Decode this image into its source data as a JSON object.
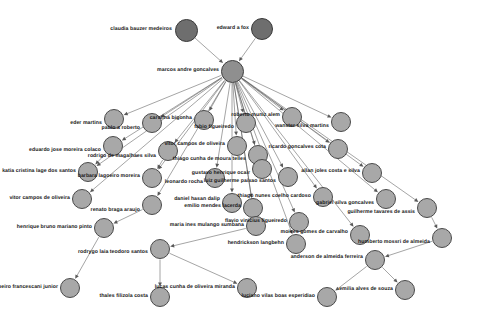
{
  "figure": {
    "type": "directed-graph",
    "title": "",
    "background_color": "#ffffff",
    "node_fill": "#a8a8a8",
    "node_fill_root": "#6e6e6e",
    "node_fill_hub": "#8f8f8f",
    "node_stroke": "#4a4a4a",
    "edge_color": "#595959"
  },
  "chart_data": {
    "type": "graph",
    "directed": true,
    "node_count": 35,
    "edge_count": 40,
    "nodes": [
      {
        "id": "claudia",
        "label": "claudia bauzer medeiros",
        "x": 186,
        "y": 30,
        "r": 11.5,
        "level": "root",
        "label_x": 172,
        "label_y": 30,
        "anchor": "end"
      },
      {
        "id": "edward",
        "label": "edward a fox",
        "x": 262,
        "y": 29,
        "r": 11.0,
        "level": "root",
        "label_x": 249,
        "label_y": 29,
        "anchor": "end"
      },
      {
        "id": "marcos",
        "label": "marcos andre goncalves",
        "x": 232,
        "y": 71,
        "r": 11.5,
        "level": "hub",
        "label_x": 219,
        "label_y": 71,
        "anchor": "end"
      },
      {
        "id": "eder",
        "label": "eder martins",
        "x": 114,
        "y": 119,
        "r": 10.0,
        "level": "child",
        "label_x": 102,
        "label_y": 124,
        "anchor": "end"
      },
      {
        "id": "pablo",
        "label": "pablo a roberto",
        "x": 152,
        "y": 123,
        "r": 10.0,
        "level": "child",
        "label_x": 140,
        "label_y": 129,
        "anchor": "end"
      },
      {
        "id": "carolina",
        "label": "carolina bigonha",
        "x": 204,
        "y": 120,
        "r": 10.0,
        "level": "child",
        "label_x": 192,
        "label_y": 119,
        "anchor": "end"
      },
      {
        "id": "fabio",
        "label": "fabio figueiredo",
        "x": 246,
        "y": 123,
        "r": 10.0,
        "level": "child",
        "label_x": 234,
        "label_y": 128,
        "anchor": "end"
      },
      {
        "id": "robertom",
        "label": "roberto muniz alem",
        "x": 292,
        "y": 117,
        "r": 10.0,
        "level": "child",
        "label_x": 280,
        "label_y": 116,
        "anchor": "end"
      },
      {
        "id": "wanster",
        "label": "wanster silva martins",
        "x": 341,
        "y": 122,
        "r": 10.0,
        "level": "child",
        "label_x": 329,
        "label_y": 127,
        "anchor": "end"
      },
      {
        "id": "eduardo",
        "label": "eduardo jose moreira colaco",
        "x": 113,
        "y": 146,
        "r": 10.0,
        "level": "child",
        "label_x": 101,
        "label_y": 151,
        "anchor": "end"
      },
      {
        "id": "rodrigo",
        "label": "rodrigo de magalhaes silva",
        "x": 168,
        "y": 151,
        "r": 10.0,
        "level": "child",
        "label_x": 156,
        "label_y": 157,
        "anchor": "end"
      },
      {
        "id": "vitorc1",
        "label": "vitor campos de oliveira",
        "x": 237,
        "y": 146,
        "r": 10.0,
        "level": "child",
        "label_x": 225,
        "label_y": 145,
        "anchor": "end"
      },
      {
        "id": "thiagocm",
        "label": "thiago cunha de moura telles",
        "x": 258,
        "y": 155,
        "r": 10.0,
        "level": "child",
        "label_x": 246,
        "label_y": 160,
        "anchor": "end"
      },
      {
        "id": "ricardo",
        "label": "ricardo goncalves cota",
        "x": 338,
        "y": 149,
        "r": 10.0,
        "level": "child",
        "label_x": 326,
        "label_y": 148,
        "anchor": "end"
      },
      {
        "id": "katia",
        "label": "katia cristina lage dos santos",
        "x": 88,
        "y": 172,
        "r": 10.0,
        "level": "child",
        "label_x": 76,
        "label_y": 172,
        "anchor": "end"
      },
      {
        "id": "barbara",
        "label": "barbara lagoeiro moreira",
        "x": 152,
        "y": 178,
        "r": 10.0,
        "level": "child",
        "label_x": 140,
        "label_y": 177,
        "anchor": "end"
      },
      {
        "id": "leonardo",
        "label": "leonardo rocha",
        "x": 215,
        "y": 178,
        "r": 10.0,
        "level": "child",
        "label_x": 203,
        "label_y": 183,
        "anchor": "end"
      },
      {
        "id": "gustavo",
        "label": "gustavo henrique ocair",
        "x": 262,
        "y": 169,
        "r": 10.0,
        "level": "child",
        "label_x": 250,
        "label_y": 174,
        "anchor": "end"
      },
      {
        "id": "luizg",
        "label": "luiz guilherme paixao santos",
        "x": 288,
        "y": 177,
        "r": 10.0,
        "level": "child",
        "label_x": 276,
        "label_y": 182,
        "anchor": "end"
      },
      {
        "id": "allan",
        "label": "allan joles costa e silva",
        "x": 372,
        "y": 173,
        "r": 10.0,
        "level": "child",
        "label_x": 360,
        "label_y": 172,
        "anchor": "end"
      },
      {
        "id": "vitorc2",
        "label": "vitor campos de oliveira",
        "x": 82,
        "y": 199,
        "r": 10.0,
        "level": "child",
        "label_x": 70,
        "label_y": 199,
        "anchor": "end"
      },
      {
        "id": "renato",
        "label": "renato braga araujo",
        "x": 152,
        "y": 205,
        "r": 10.0,
        "level": "child",
        "label_x": 140,
        "label_y": 211,
        "anchor": "end"
      },
      {
        "id": "daniel",
        "label": "daniel hasan dalip",
        "x": 232,
        "y": 203,
        "r": 10.0,
        "level": "child",
        "label_x": 220,
        "label_y": 200,
        "anchor": "end"
      },
      {
        "id": "emilio",
        "label": "emilio mendes lacerda",
        "x": 253,
        "y": 208,
        "r": 10.0,
        "level": "child",
        "label_x": 241,
        "label_y": 207,
        "anchor": "end"
      },
      {
        "id": "thiagonc",
        "label": "thiago nunes coelho cardoso",
        "x": 323,
        "y": 197,
        "r": 10.0,
        "level": "child",
        "label_x": 311,
        "label_y": 197,
        "anchor": "end"
      },
      {
        "id": "gabriel",
        "label": "gabriel silva goncalves",
        "x": 386,
        "y": 199,
        "r": 10.0,
        "level": "child",
        "label_x": 374,
        "label_y": 204,
        "anchor": "end"
      },
      {
        "id": "guilherme",
        "label": "guilherme tavares de assis",
        "x": 427,
        "y": 208,
        "r": 10.0,
        "level": "child",
        "label_x": 415,
        "label_y": 213,
        "anchor": "end"
      },
      {
        "id": "henrique",
        "label": "henrique bruno mariano pinto",
        "x": 104,
        "y": 228,
        "r": 10.0,
        "level": "child",
        "label_x": 92,
        "label_y": 228,
        "anchor": "end"
      },
      {
        "id": "mariaines",
        "label": "maria ines mulango sumbana",
        "x": 256,
        "y": 226,
        "r": 10.0,
        "level": "child",
        "label_x": 244,
        "label_y": 226,
        "anchor": "end"
      },
      {
        "id": "flavio",
        "label": "flavio vinicius figueiredo",
        "x": 299,
        "y": 222,
        "r": 10.0,
        "level": "child",
        "label_x": 287,
        "label_y": 222,
        "anchor": "end"
      },
      {
        "id": "moises",
        "label": "moises gomes de carvalho",
        "x": 360,
        "y": 235,
        "r": 10.0,
        "level": "child",
        "label_x": 348,
        "label_y": 233,
        "anchor": "end"
      },
      {
        "id": "humberto",
        "label": "humberto mossri de almeida",
        "x": 442,
        "y": 238,
        "r": 10.0,
        "level": "child",
        "label_x": 430,
        "label_y": 243,
        "anchor": "end"
      },
      {
        "id": "rodrygo",
        "label": "rodrygo laia teodoro santos",
        "x": 160,
        "y": 249,
        "r": 10.0,
        "level": "child",
        "label_x": 148,
        "label_y": 253,
        "anchor": "end"
      },
      {
        "id": "hendrickson",
        "label": "hendrickson langbehn",
        "x": 296,
        "y": 244,
        "r": 10.0,
        "level": "child",
        "label_x": 284,
        "label_y": 244,
        "anchor": "end"
      },
      {
        "id": "anderson",
        "label": "anderson de almeida ferreira",
        "x": 375,
        "y": 260,
        "r": 10.0,
        "level": "child",
        "label_x": 363,
        "label_y": 258,
        "anchor": "end"
      },
      {
        "id": "geraldo",
        "label": "geraldo ribeiro francescani junior",
        "x": 70,
        "y": 288,
        "r": 10.0,
        "level": "child",
        "label_x": 58,
        "label_y": 288,
        "anchor": "end"
      },
      {
        "id": "thales",
        "label": "thales filizola costa",
        "x": 160,
        "y": 297,
        "r": 10.0,
        "level": "child",
        "label_x": 148,
        "label_y": 297,
        "anchor": "end"
      },
      {
        "id": "lucas",
        "label": "lucas cunha de oliveira miranda",
        "x": 247,
        "y": 288,
        "r": 10.0,
        "level": "child",
        "label_x": 235,
        "label_y": 288,
        "anchor": "end"
      },
      {
        "id": "luciano",
        "label": "luciano vilas boas esperidiao",
        "x": 327,
        "y": 297,
        "r": 10.0,
        "level": "child",
        "label_x": 315,
        "label_y": 297,
        "anchor": "end"
      },
      {
        "id": "emilia",
        "label": "emilia alves de souza",
        "x": 405,
        "y": 290,
        "r": 10.0,
        "level": "child",
        "label_x": 393,
        "label_y": 290,
        "anchor": "end"
      }
    ],
    "edges": [
      {
        "from": "claudia",
        "to": "marcos"
      },
      {
        "from": "edward",
        "to": "marcos"
      },
      {
        "from": "marcos",
        "to": "eder"
      },
      {
        "from": "marcos",
        "to": "pablo"
      },
      {
        "from": "marcos",
        "to": "carolina"
      },
      {
        "from": "marcos",
        "to": "fabio"
      },
      {
        "from": "marcos",
        "to": "robertom"
      },
      {
        "from": "marcos",
        "to": "wanster"
      },
      {
        "from": "marcos",
        "to": "eduardo"
      },
      {
        "from": "marcos",
        "to": "rodrigo"
      },
      {
        "from": "marcos",
        "to": "vitorc1"
      },
      {
        "from": "marcos",
        "to": "thiagocm"
      },
      {
        "from": "marcos",
        "to": "ricardo"
      },
      {
        "from": "marcos",
        "to": "katia"
      },
      {
        "from": "marcos",
        "to": "barbara"
      },
      {
        "from": "marcos",
        "to": "leonardo"
      },
      {
        "from": "marcos",
        "to": "gustavo"
      },
      {
        "from": "marcos",
        "to": "luizg"
      },
      {
        "from": "marcos",
        "to": "allan"
      },
      {
        "from": "marcos",
        "to": "vitorc2"
      },
      {
        "from": "marcos",
        "to": "renato"
      },
      {
        "from": "marcos",
        "to": "daniel"
      },
      {
        "from": "marcos",
        "to": "emilio"
      },
      {
        "from": "marcos",
        "to": "thiagonc"
      },
      {
        "from": "marcos",
        "to": "gabriel"
      },
      {
        "from": "marcos",
        "to": "guilherme"
      },
      {
        "from": "marcos",
        "to": "mariaines"
      },
      {
        "from": "marcos",
        "to": "flavio"
      },
      {
        "from": "marcos",
        "to": "moises"
      },
      {
        "from": "marcos",
        "to": "hendrickson"
      },
      {
        "from": "eduardo",
        "to": "katia"
      },
      {
        "from": "rodrigo",
        "to": "barbara"
      },
      {
        "from": "renato",
        "to": "henrique"
      },
      {
        "from": "mariaines",
        "to": "rodrygo"
      },
      {
        "from": "guilherme",
        "to": "humberto"
      },
      {
        "from": "humberto",
        "to": "anderson"
      },
      {
        "from": "rodrygo",
        "to": "thales"
      },
      {
        "from": "rodrygo",
        "to": "lucas"
      },
      {
        "from": "henrique",
        "to": "geraldo"
      },
      {
        "from": "anderson",
        "to": "luciano"
      },
      {
        "from": "anderson",
        "to": "emilia"
      }
    ]
  }
}
